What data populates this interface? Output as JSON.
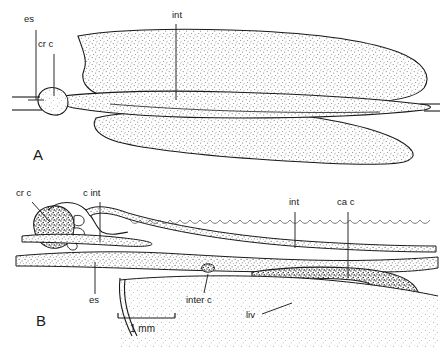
{
  "figure": {
    "background_color": "#ffffff",
    "ink_color": "#1a1a1a",
    "stipple_fill": "#d8d8d8",
    "dark_fill": "#3a3a3a"
  },
  "panels": [
    {
      "id": "A",
      "letter": "A",
      "view": "dorsal whole-mount of digestive tract",
      "labels": [
        {
          "key": "es",
          "text": "es",
          "x": 24,
          "y": 22,
          "leader_x": 36,
          "leader_y1": 30,
          "leader_y2": 100
        },
        {
          "key": "cr_c",
          "text": "cr c",
          "x": 38,
          "y": 47,
          "leader_x": 54,
          "leader_y1": 54,
          "leader_y2": 96
        },
        {
          "key": "int",
          "text": "int",
          "x": 172,
          "y": 18,
          "leader_x": 176,
          "leader_y1": 24,
          "leader_y2": 100
        }
      ]
    },
    {
      "id": "B",
      "letter": "B",
      "view": "lateral section showing crop, caeca and liver",
      "labels": [
        {
          "key": "cr_c",
          "text": "cr c",
          "x": 16,
          "y": 196,
          "leader": "M32,202 L50,222"
        },
        {
          "key": "c_int",
          "text": "c int",
          "x": 83,
          "y": 196,
          "leader": "M100,202 L100,242"
        },
        {
          "key": "int",
          "text": "int",
          "x": 289,
          "y": 205,
          "leader": "M295,212 L295,248"
        },
        {
          "key": "ca_c",
          "text": "ca c",
          "x": 337,
          "y": 205,
          "leader": "M348,212 L348,278"
        },
        {
          "key": "es",
          "text": "es",
          "x": 89,
          "y": 300,
          "leader": "M95,294 L95,262"
        },
        {
          "key": "inter_c",
          "text": "inter c",
          "x": 186,
          "y": 300,
          "leader": "M204,293 L208,274"
        },
        {
          "key": "liv",
          "text": "liv",
          "x": 247,
          "y": 317,
          "leader": "M262,314 L290,304"
        }
      ],
      "scale_bar": {
        "label": "1 mm",
        "x1": 118,
        "x2": 175,
        "y": 318
      }
    }
  ],
  "abbreviations": {
    "es": "oesophagus",
    "cr c": "crop caecum",
    "c int": "crop intestine",
    "int": "intestine",
    "ca c": "caudal caecum",
    "inter c": "intercalary caecum",
    "liv": "liver"
  }
}
